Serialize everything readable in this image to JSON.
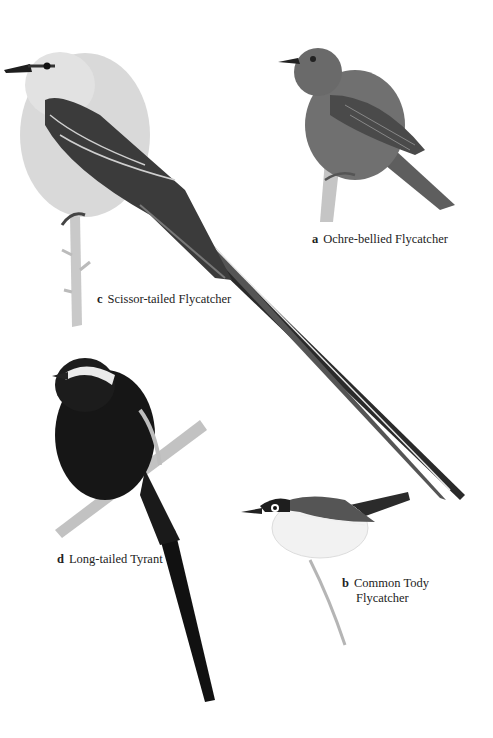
{
  "plate": {
    "species": [
      {
        "letter": "a",
        "name": "Ochre-bellied Flycatcher",
        "name_line2": ""
      },
      {
        "letter": "b",
        "name": "Common Tody",
        "name_line2": "Flycatcher"
      },
      {
        "letter": "c",
        "name": "Scissor-tailed Flycatcher",
        "name_line2": ""
      },
      {
        "letter": "d",
        "name": "Long-tailed Tyrant",
        "name_line2": ""
      }
    ],
    "colors": {
      "background": "#ffffff",
      "ochre_body": "#6e6e6e",
      "scissor_body": "#d6d6d6",
      "scissor_wing": "#3a3a3a",
      "tyrant_body": "#151515",
      "tody_back": "#555555",
      "tody_belly": "#f4f4f4",
      "branch": "#b8b8b8"
    }
  }
}
